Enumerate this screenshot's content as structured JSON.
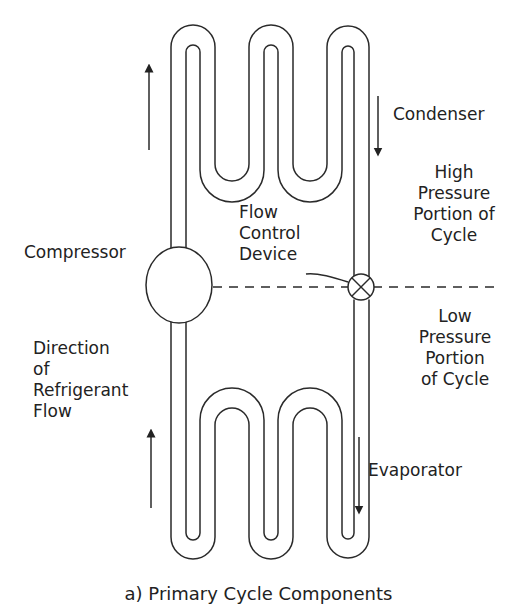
{
  "diagram": {
    "caption": "a) Primary Cycle Components",
    "components": {
      "condenser": "Condenser",
      "compressor": "Compressor",
      "flow_control": [
        "Flow",
        "Control",
        "Device"
      ],
      "evaporator": "Evaporator"
    },
    "regions": {
      "high_pressure": [
        "High",
        "Pressure",
        "Portion of",
        "Cycle"
      ],
      "low_pressure": [
        "Low",
        "Pressure",
        "Portion",
        "of Cycle"
      ]
    },
    "flow_label": [
      "Direction",
      "of",
      "Refrigerant",
      "Flow"
    ],
    "arrows": [
      {
        "name": "upper-left-arrow",
        "direction": "up"
      },
      {
        "name": "condenser-arrow",
        "direction": "down"
      },
      {
        "name": "lower-left-arrow",
        "direction": "up"
      },
      {
        "name": "evaporator-arrow",
        "direction": "down"
      }
    ],
    "colors": {
      "line": "#2a2a2a",
      "background": "#ffffff"
    }
  }
}
